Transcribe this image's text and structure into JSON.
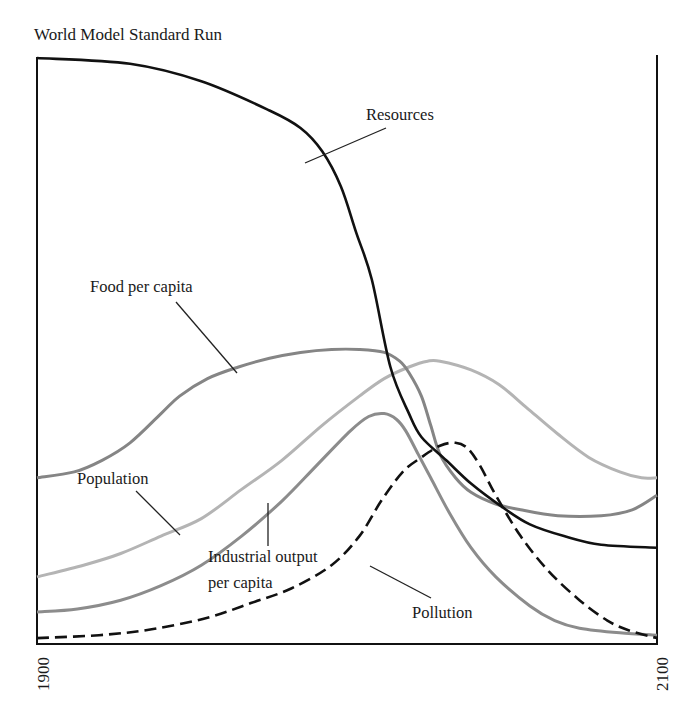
{
  "chart_data": {
    "type": "line",
    "title": "World Model Standard Run",
    "xlabel": "",
    "ylabel": "",
    "xlim": [
      1900,
      2100
    ],
    "ylim": [
      0,
      1
    ],
    "x_tick_labels": [
      "1900",
      "2100"
    ],
    "grid": false,
    "legend": "none (inline labels with leader lines)",
    "series": [
      {
        "name": "Resources",
        "label": "Resources",
        "color": "#111111",
        "style": "solid",
        "points": [
          [
            1900,
            1.0
          ],
          [
            1930,
            0.99
          ],
          [
            1953,
            0.96
          ],
          [
            1975,
            0.91
          ],
          [
            1985,
            0.88
          ],
          [
            1992,
            0.84
          ],
          [
            1998,
            0.78
          ],
          [
            2003,
            0.7
          ],
          [
            2008,
            0.62
          ],
          [
            2014,
            0.47
          ],
          [
            2020,
            0.39
          ],
          [
            2024,
            0.35
          ],
          [
            2032,
            0.31
          ],
          [
            2040,
            0.27
          ],
          [
            2050,
            0.23
          ],
          [
            2059,
            0.2
          ],
          [
            2070,
            0.18
          ],
          [
            2082,
            0.165
          ],
          [
            2100,
            0.16
          ]
        ]
      },
      {
        "name": "Food per capita",
        "label": "Food per capita",
        "color": "#858585",
        "style": "solid",
        "points": [
          [
            1900,
            0.28
          ],
          [
            1912,
            0.29
          ],
          [
            1921,
            0.31
          ],
          [
            1930,
            0.34
          ],
          [
            1940,
            0.39
          ],
          [
            1946,
            0.42
          ],
          [
            1955,
            0.45
          ],
          [
            1965,
            0.47
          ],
          [
            1975,
            0.485
          ],
          [
            1985,
            0.495
          ],
          [
            1995,
            0.5
          ],
          [
            2004,
            0.5
          ],
          [
            2012,
            0.495
          ],
          [
            2017,
            0.48
          ],
          [
            2020,
            0.46
          ],
          [
            2024,
            0.42
          ],
          [
            2027,
            0.37
          ],
          [
            2030,
            0.32
          ],
          [
            2035,
            0.28
          ],
          [
            2040,
            0.255
          ],
          [
            2048,
            0.235
          ],
          [
            2056,
            0.225
          ],
          [
            2068,
            0.215
          ],
          [
            2082,
            0.215
          ],
          [
            2092,
            0.225
          ],
          [
            2100,
            0.25
          ]
        ]
      },
      {
        "name": "Population",
        "label": "Population",
        "color": "#b4b4b4",
        "style": "solid",
        "points": [
          [
            1900,
            0.11
          ],
          [
            1915,
            0.13
          ],
          [
            1927,
            0.15
          ],
          [
            1940,
            0.18
          ],
          [
            1953,
            0.21
          ],
          [
            1966,
            0.26
          ],
          [
            1979,
            0.31
          ],
          [
            1992,
            0.37
          ],
          [
            2004,
            0.42
          ],
          [
            2012,
            0.45
          ],
          [
            2020,
            0.47
          ],
          [
            2026,
            0.48
          ],
          [
            2030,
            0.48
          ],
          [
            2040,
            0.465
          ],
          [
            2049,
            0.44
          ],
          [
            2058,
            0.4
          ],
          [
            2068,
            0.355
          ],
          [
            2078,
            0.315
          ],
          [
            2088,
            0.29
          ],
          [
            2095,
            0.28
          ],
          [
            2100,
            0.28
          ]
        ]
      },
      {
        "name": "Industrial output per capita",
        "label": "Industrial output per capita",
        "color": "#8c8c8c",
        "style": "solid",
        "points": [
          [
            1900,
            0.05
          ],
          [
            1913,
            0.055
          ],
          [
            1927,
            0.07
          ],
          [
            1940,
            0.095
          ],
          [
            1953,
            0.13
          ],
          [
            1966,
            0.18
          ],
          [
            1979,
            0.24
          ],
          [
            1990,
            0.3
          ],
          [
            2001,
            0.36
          ],
          [
            2007,
            0.385
          ],
          [
            2012,
            0.39
          ],
          [
            2016,
            0.38
          ],
          [
            2019,
            0.36
          ],
          [
            2023,
            0.32
          ],
          [
            2027,
            0.28
          ],
          [
            2033,
            0.22
          ],
          [
            2040,
            0.16
          ],
          [
            2048,
            0.11
          ],
          [
            2059,
            0.06
          ],
          [
            2067,
            0.035
          ],
          [
            2075,
            0.022
          ],
          [
            2088,
            0.014
          ],
          [
            2100,
            0.01
          ]
        ]
      },
      {
        "name": "Pollution",
        "label": "Pollution",
        "color": "#111111",
        "style": "dashed",
        "points": [
          [
            1900,
            0.005
          ],
          [
            1920,
            0.01
          ],
          [
            1937,
            0.02
          ],
          [
            1955,
            0.04
          ],
          [
            1969,
            0.065
          ],
          [
            1982,
            0.09
          ],
          [
            1995,
            0.13
          ],
          [
            2004,
            0.18
          ],
          [
            2011,
            0.24
          ],
          [
            2018,
            0.29
          ],
          [
            2024,
            0.315
          ],
          [
            2030,
            0.335
          ],
          [
            2035,
            0.34
          ],
          [
            2039,
            0.33
          ],
          [
            2043,
            0.3
          ],
          [
            2048,
            0.25
          ],
          [
            2056,
            0.18
          ],
          [
            2065,
            0.12
          ],
          [
            2075,
            0.07
          ],
          [
            2084,
            0.035
          ],
          [
            2091,
            0.018
          ],
          [
            2100,
            0.005
          ]
        ]
      }
    ]
  }
}
